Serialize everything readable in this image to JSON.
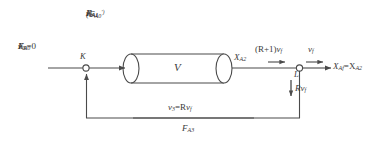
{
  "diagram": {
    "colors": {
      "line": "#4a4a4a",
      "text": "#3a3a3a",
      "background": "#ffffff",
      "node_fill": "#ffffff"
    },
    "vessel": {
      "name": "reactor-vessel",
      "label": "V"
    },
    "nodes": {
      "mix_point": "K",
      "split_point": "L"
    },
    "feed_stream": {
      "molar_flow": "F",
      "molar_flow_sub": "A0",
      "volumetric_flow": "v",
      "volumetric_flow_sub": "0",
      "conversion": "X",
      "conversion_sub": "0",
      "conversion_value": "=0"
    },
    "inlet_stream": {
      "primed_flow": "(F",
      "primed_flow_sub": "A0",
      "primed_flow_prime": "′)",
      "molar_flow": "F",
      "molar_flow_sub": "A1",
      "conversion": "X",
      "conversion_sub": "A1",
      "volumetric_flow": "v",
      "volumetric_flow_sub": "1"
    },
    "outlet_stream": {
      "conversion": "X",
      "conversion_sub": "A2",
      "combined_flow_pre": "(R+1)",
      "combined_flow_v": "v",
      "combined_flow_sub": "f"
    },
    "product_stream": {
      "volumetric_flow": "v",
      "volumetric_flow_sub": "f",
      "conversion": "X",
      "conversion_sub": "Af",
      "conversion_eq": "=X",
      "conversion_eq_sub": "A2"
    },
    "recycle_down": {
      "flow": "R",
      "flow_v": "v",
      "flow_sub": "f"
    },
    "recycle_stream": {
      "volumetric_flow": "v",
      "volumetric_flow_sub": "3",
      "equals": "=R",
      "equals_v": "v",
      "equals_sub": "f",
      "molar_flow": "F",
      "molar_flow_sub": "A3"
    }
  }
}
